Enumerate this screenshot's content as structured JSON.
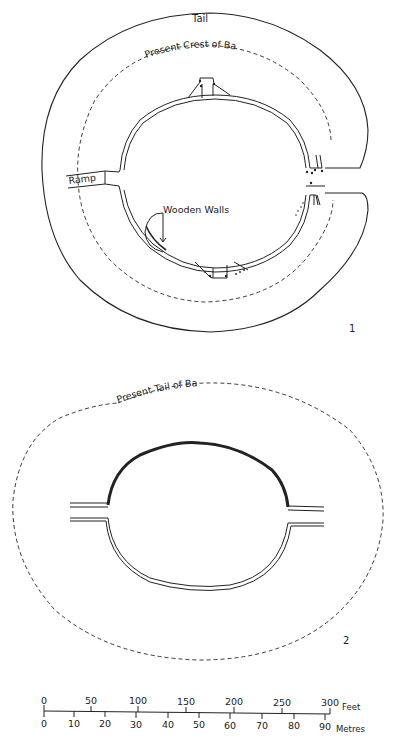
{
  "figure_1": {
    "number": "1",
    "labels": {
      "tail": "Tail",
      "crest": "Present Crest of Bank",
      "ramp": "Ramp",
      "wooden_walls": "Wooden Walls"
    }
  },
  "figure_2": {
    "number": "2",
    "labels": {
      "tail": "Present Tail of Bank"
    }
  },
  "scale_bar": {
    "feet_unit": "Feet",
    "metres_unit": "Metres",
    "feet_ticks": [
      "0",
      "50",
      "100",
      "150",
      "200",
      "250",
      "300"
    ],
    "metres_ticks": [
      "0",
      "10",
      "20",
      "30",
      "40",
      "50",
      "60",
      "70",
      "80",
      "90"
    ]
  }
}
